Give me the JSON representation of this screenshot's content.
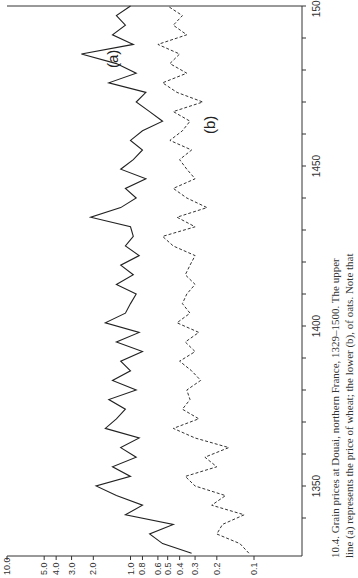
{
  "figure": {
    "caption_line1": "10.4. Grain prices at Douai, northern France, 1329–1500. The upper",
    "caption_line2": "line (a) represents the price of wheat; the lower (b), of oats. Note that",
    "caption_number": "10.4."
  },
  "chart_data": {
    "type": "line",
    "title": "Grain prices at Douai, northern France, 1329–1500",
    "xlabel": "",
    "ylabel": "",
    "orientation": "figure rotated 90° counterclockwise on the page",
    "x_range": [
      1329,
      1500
    ],
    "x_ticks": [
      "1350",
      "1400",
      "1450",
      "1500"
    ],
    "y_scale": "log",
    "ylim": [
      0.1,
      10.0
    ],
    "y_ticks": [
      "10.0",
      "5.0",
      "4.0",
      "3.0",
      "2.0",
      "1.0",
      "0.8",
      "0.6",
      "0.5",
      "0.4",
      "0.3",
      "0.2",
      "0.1"
    ],
    "grid": false,
    "legend": "inline labels (a) and (b)",
    "series": [
      {
        "name": "(a) wheat",
        "style": "solid",
        "x": [
          1329,
          1332,
          1335,
          1338,
          1341,
          1344,
          1347,
          1350,
          1353,
          1356,
          1359,
          1362,
          1365,
          1368,
          1371,
          1374,
          1377,
          1380,
          1383,
          1386,
          1389,
          1392,
          1395,
          1398,
          1401,
          1404,
          1407,
          1410,
          1413,
          1416,
          1419,
          1422,
          1425,
          1428,
          1431,
          1434,
          1437,
          1440,
          1443,
          1446,
          1449,
          1452,
          1455,
          1458,
          1461,
          1464,
          1467,
          1470,
          1473,
          1476,
          1479,
          1482,
          1485,
          1488,
          1491,
          1494,
          1497,
          1500
        ],
        "values": [
          0.32,
          0.55,
          0.7,
          0.45,
          1.1,
          0.8,
          1.3,
          1.9,
          1.0,
          1.4,
          0.9,
          1.2,
          0.85,
          1.6,
          1.3,
          1.1,
          1.5,
          0.9,
          1.4,
          1.0,
          1.2,
          0.8,
          1.3,
          0.85,
          1.6,
          1.1,
          1.0,
          0.9,
          1.3,
          0.95,
          1.2,
          0.85,
          1.1,
          0.95,
          1.0,
          2.1,
          1.2,
          0.9,
          1.1,
          0.75,
          1.2,
          0.95,
          0.8,
          1.0,
          0.8,
          0.55,
          0.7,
          0.9,
          0.75,
          1.5,
          0.9,
          1.3,
          2.5,
          0.95,
          1.4,
          1.1,
          1.3,
          1.0
        ]
      },
      {
        "name": "(b) oats",
        "style": "dashed",
        "x": [
          1329,
          1332,
          1335,
          1338,
          1341,
          1344,
          1347,
          1350,
          1353,
          1356,
          1359,
          1362,
          1365,
          1368,
          1371,
          1374,
          1377,
          1380,
          1383,
          1386,
          1389,
          1392,
          1395,
          1398,
          1401,
          1404,
          1407,
          1410,
          1413,
          1416,
          1419,
          1422,
          1425,
          1428,
          1431,
          1434,
          1437,
          1440,
          1443,
          1446,
          1449,
          1452,
          1455,
          1458,
          1461,
          1464,
          1467,
          1470,
          1473,
          1476,
          1479,
          1482,
          1485,
          1488,
          1491,
          1494,
          1497,
          1500
        ],
        "values": [
          0.11,
          0.13,
          0.2,
          0.18,
          0.12,
          0.22,
          0.17,
          0.3,
          0.36,
          0.2,
          0.25,
          0.16,
          0.3,
          0.45,
          0.28,
          0.38,
          0.33,
          0.35,
          0.27,
          0.32,
          0.4,
          0.3,
          0.36,
          0.28,
          0.42,
          0.33,
          0.38,
          0.35,
          0.3,
          0.36,
          0.33,
          0.3,
          0.45,
          0.55,
          0.3,
          0.42,
          0.24,
          0.35,
          0.45,
          0.3,
          0.35,
          0.4,
          0.32,
          0.48,
          0.38,
          0.33,
          0.45,
          0.26,
          0.42,
          0.55,
          0.35,
          0.48,
          0.4,
          0.6,
          0.35,
          0.45,
          0.38,
          0.5
        ]
      }
    ],
    "annotations": [
      "(a)",
      "(b)"
    ]
  }
}
